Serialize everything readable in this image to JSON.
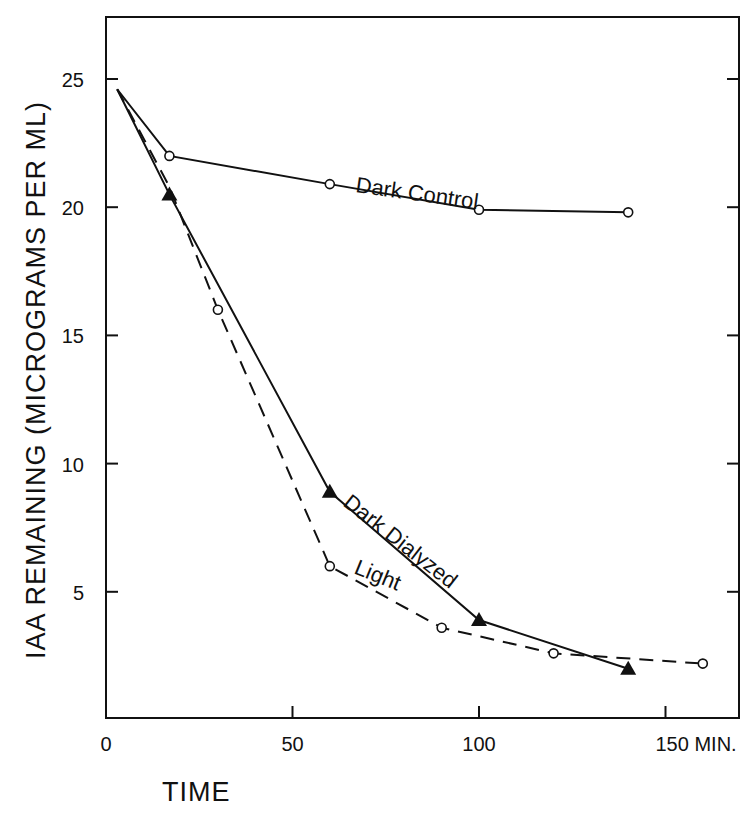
{
  "chart_data": {
    "type": "line",
    "title": "",
    "xlabel": "TIME",
    "xunit": "MIN.",
    "ylabel": "IAA  REMAINING   (MICROGRAMS PER ML)",
    "xlim": [
      0,
      165
    ],
    "ylim": [
      0,
      27
    ],
    "xticks": [
      0,
      50,
      100,
      150
    ],
    "xtick_labels": [
      "0",
      "50",
      "100",
      "150 MIN."
    ],
    "yticks": [
      5,
      10,
      15,
      20,
      25
    ],
    "ytick_labels": [
      "5",
      "10",
      "15",
      "20",
      "25"
    ],
    "grid": false,
    "legend": "inline labels",
    "series": [
      {
        "name": "Dark Control",
        "style": "solid",
        "marker": "open-circle",
        "x": [
          3,
          17,
          60,
          100,
          140
        ],
        "y": [
          24.6,
          22.0,
          20.9,
          19.9,
          19.8
        ]
      },
      {
        "name": "Dark Dialyzed",
        "style": "solid",
        "marker": "filled-triangle",
        "x": [
          3,
          17,
          60,
          100,
          140
        ],
        "y": [
          24.6,
          20.5,
          8.9,
          3.9,
          2.0
        ]
      },
      {
        "name": "Light",
        "style": "dashed",
        "marker": "open-circle",
        "x": [
          3,
          17,
          30,
          60,
          90,
          120,
          160
        ],
        "y": [
          24.6,
          20.8,
          16.0,
          6.0,
          3.6,
          2.6,
          2.2
        ]
      }
    ],
    "annotations": [
      "Dark Control",
      "Dark Dialyzed",
      "Light"
    ]
  },
  "labels": {
    "y_axis": "IAA  REMAINING   (MICROGRAMS PER ML)",
    "x_axis": "TIME"
  }
}
